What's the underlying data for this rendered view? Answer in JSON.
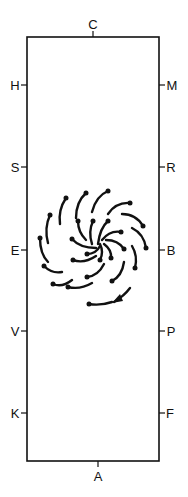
{
  "diagram": {
    "frame": {
      "x": 27,
      "y": 37,
      "width": 132,
      "height": 424,
      "stroke": "#111111"
    },
    "labels": {
      "top": "C",
      "bottom": "A",
      "left": [
        "H",
        "S",
        "E",
        "V",
        "K"
      ],
      "right": [
        "M",
        "R",
        "B",
        "P",
        "F"
      ]
    },
    "spiral": {
      "center": [
        100,
        243
      ],
      "rotation": "clockwise",
      "arrow_label": "direction-arrow",
      "color": "#111111"
    }
  }
}
